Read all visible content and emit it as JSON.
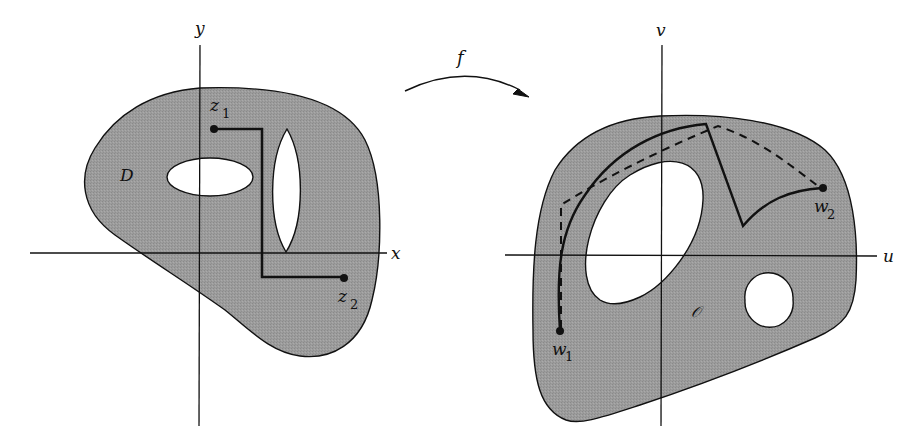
{
  "colors": {
    "region_fill": "#9a9a9a",
    "hole_fill": "#ffffff",
    "stroke": "#111111",
    "background": "#ffffff"
  },
  "mapping": {
    "label": "f"
  },
  "left_plane": {
    "x_axis_label": "x",
    "y_axis_label": "y",
    "region_label": "D",
    "points": [
      {
        "name": "z",
        "subscript": "1"
      },
      {
        "name": "z",
        "subscript": "2"
      }
    ]
  },
  "right_plane": {
    "u_axis_label": "u",
    "v_axis_label": "v",
    "region_label": "𝒪",
    "points": [
      {
        "name": "w",
        "subscript": "1"
      },
      {
        "name": "w",
        "subscript": "2"
      }
    ]
  }
}
